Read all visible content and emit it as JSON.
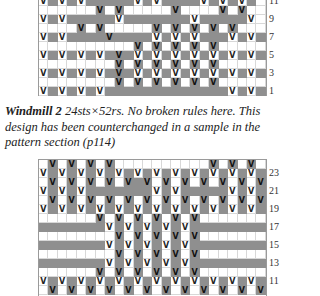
{
  "top_chart": {
    "rows": [
      {
        "label": "11",
        "cells": "v#v#v#####v#v####v#v#v#."
      },
      {
        "label": "",
        "cells": "......V.V.....V....V.V.."
      },
      {
        "label": "9",
        "cells": "v#v#####v#######v#####v."
      },
      {
        "label": "",
        "cells": "....V.V.....V.V.V.V.V..."
      },
      {
        "label": "7",
        "cells": "v#v####V####v#v#v###v#v#"
      },
      {
        "label": "",
        "cells": "..........V.V.V.V.V....."
      },
      {
        "label": "5",
        "cells": "v#v#v#v#V#v#v#v#v#v#v#v#"
      },
      {
        "label": "",
        "cells": "........V.V.V.V.V.V....."
      },
      {
        "label": "3",
        "cells": "v#v#v#v#V#v#v#v#v#v#v#v#"
      },
      {
        "label": "",
        "cells": "........V.V.V.V.V.V....."
      },
      {
        "label": "1",
        "cells": "v#v#v#v#############v#v#"
      }
    ]
  },
  "caption": {
    "title": "Windmill 2",
    "text": "  24sts×52rs. No broken rules here. This design has been counterchanged in a sample in the pattern section (p114)"
  },
  "bottom_chart": {
    "rows": [
      {
        "label": "",
        "cells": ".V.V.V.V..........V.V.V.V"
      },
      {
        "label": "23",
        "cells": "v#v#v#v#v#v#v#v#v#v#v#v#"
      },
      {
        "label": "",
        "cells": ".V.V.V.V.V#V.V.V.V.V.V.V"
      },
      {
        "label": "21",
        "cells": "v#v#v#######v#v#####v#v#"
      },
      {
        "label": "",
        "cells": ".V.V.V.V.V.V.V.V.V.V.V.V"
      },
      {
        "label": "19",
        "cells": "v#v#v#v#v#v#v#v#v#v#v#v#"
      },
      {
        "label": "",
        "cells": "......V.V.V.V.V.V......."
      },
      {
        "label": "17",
        "cells": "#######v#v#v#v#v########"
      },
      {
        "label": "",
        "cells": "........V.V.V.V.V......."
      },
      {
        "label": "15",
        "cells": "#######v#v#v#v#v########"
      },
      {
        "label": "",
        "cells": "........V.V.V.V.V......."
      },
      {
        "label": "13",
        "cells": "#######v#v#v#v#v########"
      },
      {
        "label": "",
        "cells": "......V.V.V.V.V.V......."
      },
      {
        "label": "11",
        "cells": "v#v#v#v#v#v#v#v#v#v#v#v#"
      },
      {
        "label": "",
        "cells": ".V.V.V.V.V.V.V.V.V.V.V.V"
      }
    ]
  },
  "symbols": {
    "slip_stitch": "V"
  }
}
